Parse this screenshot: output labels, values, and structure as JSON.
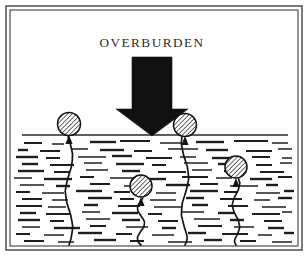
{
  "figure": {
    "title": "OVERBURDEN",
    "domain_type": "diagram",
    "caption_visible": false,
    "background_color": "#ffffff",
    "ink_color": "#111111",
    "frame": {
      "style": "double-rule-rectangle",
      "outer_color": "#5a5a5a",
      "inner_color": "#3d3d3d",
      "outer": {
        "x": 6,
        "y": 6,
        "width": 296,
        "height": 244
      },
      "inner": {
        "x": 10,
        "y": 10,
        "width": 288,
        "height": 236
      }
    },
    "title_position": {
      "x": 152,
      "y": 44
    },
    "load_arrow": {
      "name": "overburden-load-arrow",
      "color": "#111111",
      "direction": "down",
      "shaft": {
        "x": 132,
        "y": 57,
        "width": 40,
        "height": 52
      },
      "head": {
        "left": 116,
        "right": 188,
        "top": 109,
        "tip_x": 152,
        "tip_y": 136
      }
    },
    "ground_line": {
      "name": "ground-surface-line",
      "y": 135,
      "x_start": 22,
      "x_end": 288,
      "color": "#2a2a2a",
      "width": 1.5
    },
    "soil_region": {
      "name": "soil-hatch-region",
      "top": 137,
      "bottom": 245,
      "left": 14,
      "right": 294,
      "pattern": "short-horizontal-dashes",
      "dash_color": "#1e1e1e",
      "dash_count": 118
    },
    "gas_bubbles": [
      {
        "name": "gas-bubble-1",
        "label": "surface-left-bubble",
        "cx": 69,
        "cy": 124,
        "r": 11.5,
        "fill": "#e8e8e8",
        "hatch": "diagonal-45",
        "crack_from_y": 245,
        "crack_to_y": 136
      },
      {
        "name": "gas-bubble-2",
        "label": "surface-right-bubble",
        "cx": 185,
        "cy": 125,
        "r": 11.5,
        "fill": "#e8e8e8",
        "hatch": "diagonal-45",
        "crack_from_y": 245,
        "crack_to_y": 137
      },
      {
        "name": "gas-bubble-3",
        "label": "deep-center-bubble",
        "cx": 141,
        "cy": 186,
        "r": 11,
        "fill": "#e8e8e8",
        "hatch": "diagonal-45",
        "crack_from_y": 245,
        "crack_to_y": 198
      },
      {
        "name": "gas-bubble-4",
        "label": "mid-right-bubble",
        "cx": 236,
        "cy": 167,
        "r": 11,
        "fill": "#e8e8e8",
        "hatch": "diagonal-45",
        "crack_from_y": 245,
        "crack_to_y": 179
      }
    ],
    "soil_dashes": [
      [
        24,
        143,
        18
      ],
      [
        52,
        144,
        12
      ],
      [
        90,
        142,
        26
      ],
      [
        120,
        141,
        30
      ],
      [
        160,
        143,
        22
      ],
      [
        196,
        142,
        28
      ],
      [
        234,
        141,
        34
      ],
      [
        272,
        143,
        16
      ],
      [
        18,
        150,
        10
      ],
      [
        40,
        151,
        20
      ],
      [
        72,
        149,
        16
      ],
      [
        100,
        150,
        24
      ],
      [
        134,
        151,
        18
      ],
      [
        168,
        149,
        30
      ],
      [
        206,
        150,
        22
      ],
      [
        246,
        151,
        26
      ],
      [
        278,
        149,
        14
      ],
      [
        16,
        157,
        22
      ],
      [
        46,
        158,
        14
      ],
      [
        78,
        157,
        28
      ],
      [
        112,
        156,
        20
      ],
      [
        146,
        158,
        26
      ],
      [
        180,
        157,
        16
      ],
      [
        212,
        158,
        30
      ],
      [
        252,
        157,
        18
      ],
      [
        282,
        158,
        10
      ],
      [
        22,
        164,
        16
      ],
      [
        50,
        165,
        24
      ],
      [
        84,
        163,
        18
      ],
      [
        116,
        164,
        28
      ],
      [
        152,
        165,
        14
      ],
      [
        184,
        163,
        24
      ],
      [
        218,
        164,
        20
      ],
      [
        256,
        165,
        16
      ],
      [
        280,
        163,
        12
      ],
      [
        18,
        171,
        26
      ],
      [
        54,
        172,
        16
      ],
      [
        86,
        170,
        22
      ],
      [
        122,
        171,
        18
      ],
      [
        158,
        172,
        28
      ],
      [
        192,
        170,
        20
      ],
      [
        224,
        171,
        14
      ],
      [
        260,
        172,
        24
      ],
      [
        14,
        178,
        18
      ],
      [
        44,
        179,
        28
      ],
      [
        80,
        177,
        14
      ],
      [
        110,
        178,
        24
      ],
      [
        148,
        179,
        18
      ],
      [
        182,
        177,
        26
      ],
      [
        216,
        178,
        16
      ],
      [
        250,
        179,
        22
      ],
      [
        278,
        177,
        14
      ],
      [
        20,
        185,
        24
      ],
      [
        56,
        186,
        14
      ],
      [
        90,
        184,
        20
      ],
      [
        124,
        186,
        16
      ],
      [
        166,
        185,
        24
      ],
      [
        200,
        184,
        18
      ],
      [
        230,
        186,
        28
      ],
      [
        266,
        185,
        12
      ],
      [
        16,
        192,
        14
      ],
      [
        42,
        193,
        22
      ],
      [
        76,
        191,
        26
      ],
      [
        114,
        192,
        16
      ],
      [
        156,
        193,
        20
      ],
      [
        190,
        191,
        28
      ],
      [
        224,
        192,
        14
      ],
      [
        256,
        193,
        24
      ],
      [
        284,
        191,
        10
      ],
      [
        22,
        199,
        20
      ],
      [
        52,
        200,
        16
      ],
      [
        88,
        198,
        24
      ],
      [
        120,
        199,
        14
      ],
      [
        150,
        200,
        26
      ],
      [
        186,
        198,
        18
      ],
      [
        220,
        199,
        22
      ],
      [
        254,
        200,
        16
      ],
      [
        278,
        198,
        14
      ],
      [
        16,
        206,
        26
      ],
      [
        48,
        207,
        18
      ],
      [
        84,
        205,
        14
      ],
      [
        118,
        206,
        22
      ],
      [
        154,
        207,
        28
      ],
      [
        192,
        205,
        16
      ],
      [
        228,
        206,
        20
      ],
      [
        262,
        207,
        24
      ],
      [
        20,
        213,
        16
      ],
      [
        46,
        214,
        24
      ],
      [
        82,
        212,
        18
      ],
      [
        112,
        213,
        26
      ],
      [
        148,
        214,
        14
      ],
      [
        182,
        212,
        22
      ],
      [
        218,
        213,
        16
      ],
      [
        252,
        214,
        28
      ],
      [
        282,
        212,
        10
      ],
      [
        18,
        220,
        22
      ],
      [
        50,
        221,
        14
      ],
      [
        86,
        219,
        24
      ],
      [
        122,
        220,
        18
      ],
      [
        158,
        221,
        20
      ],
      [
        194,
        219,
        26
      ],
      [
        230,
        220,
        14
      ],
      [
        264,
        221,
        18
      ],
      [
        22,
        227,
        18
      ],
      [
        54,
        228,
        26
      ],
      [
        90,
        226,
        16
      ],
      [
        126,
        227,
        22
      ],
      [
        162,
        228,
        14
      ],
      [
        198,
        226,
        24
      ],
      [
        234,
        227,
        20
      ],
      [
        268,
        228,
        16
      ],
      [
        16,
        234,
        14
      ],
      [
        44,
        235,
        20
      ],
      [
        78,
        233,
        24
      ],
      [
        116,
        234,
        16
      ],
      [
        152,
        235,
        22
      ],
      [
        188,
        233,
        18
      ],
      [
        222,
        234,
        26
      ],
      [
        258,
        235,
        14
      ],
      [
        284,
        233,
        10
      ],
      [
        24,
        241,
        20
      ],
      [
        58,
        242,
        16
      ],
      [
        94,
        240,
        22
      ],
      [
        130,
        241,
        14
      ],
      [
        168,
        242,
        24
      ],
      [
        204,
        240,
        18
      ],
      [
        240,
        241,
        16
      ],
      [
        272,
        242,
        20
      ]
    ]
  }
}
